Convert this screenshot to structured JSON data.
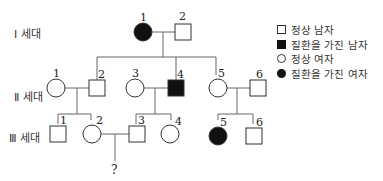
{
  "generations": [
    {
      "id": "I",
      "label": "Ⅰ 세대"
    },
    {
      "id": "II",
      "label": "Ⅱ 세대"
    },
    {
      "id": "III",
      "label": "Ⅲ 세대"
    }
  ],
  "legend": [
    {
      "symbol": "square-open",
      "label": "정상 남자"
    },
    {
      "symbol": "square-filled",
      "label": "질환을 가진 남자"
    },
    {
      "symbol": "circle-open",
      "label": "정상 여자"
    },
    {
      "symbol": "circle-filled",
      "label": "질환을 가진 여자"
    }
  ],
  "individuals": {
    "I_1": {
      "number": "1",
      "sex": "female",
      "affected": true
    },
    "I_2": {
      "number": "2",
      "sex": "male",
      "affected": false
    },
    "II_1": {
      "number": "1",
      "sex": "female",
      "affected": false
    },
    "II_2": {
      "number": "2",
      "sex": "male",
      "affected": false
    },
    "II_3": {
      "number": "3",
      "sex": "female",
      "affected": false
    },
    "II_4": {
      "number": "4",
      "sex": "male",
      "affected": true
    },
    "II_5": {
      "number": "5",
      "sex": "female",
      "affected": false
    },
    "II_6": {
      "number": "6",
      "sex": "male",
      "affected": false
    },
    "III_1": {
      "number": "1",
      "sex": "male",
      "affected": false
    },
    "III_2": {
      "number": "2",
      "sex": "female",
      "affected": false
    },
    "III_3": {
      "number": "3",
      "sex": "male",
      "affected": false
    },
    "III_4": {
      "number": "4",
      "sex": "female",
      "affected": false
    },
    "III_5": {
      "number": "5",
      "sex": "female",
      "affected": true
    },
    "III_6": {
      "number": "6",
      "sex": "male",
      "affected": false
    }
  },
  "unknown_child": "?",
  "colors": {
    "affected": "#111111",
    "line": "#666666",
    "outline": "#333333"
  }
}
